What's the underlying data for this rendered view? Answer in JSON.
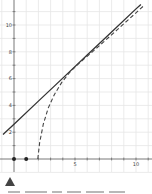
{
  "chart_data": {
    "type": "line",
    "title": "",
    "xlabel": "",
    "ylabel": "",
    "xlim": [
      -1.1,
      11
    ],
    "ylim": [
      -0.6,
      11.8
    ],
    "grid": true,
    "x_ticks": [
      {
        "value": 5,
        "label": "5"
      },
      {
        "value": 10,
        "label": "10"
      }
    ],
    "y_ticks": [
      {
        "value": 2,
        "label": "2"
      },
      {
        "value": 4,
        "label": "4"
      },
      {
        "value": 6,
        "label": "6"
      },
      {
        "value": 8,
        "label": "8"
      },
      {
        "value": 10,
        "label": "10"
      }
    ],
    "series": [
      {
        "name": "solid-line",
        "style": "solid",
        "color": "#333333",
        "x": [
          -0.9,
          0,
          2,
          4,
          6,
          8,
          10,
          10.4
        ],
        "y": [
          1.83,
          2.6,
          4.32,
          6.04,
          7.76,
          9.48,
          11.2,
          11.54
        ]
      },
      {
        "name": "dashed-curve",
        "style": "dashed",
        "color": "#444444",
        "x": [
          1.95,
          2.1,
          2.4,
          2.8,
          3.3,
          3.9,
          4.6,
          5.4,
          6.3,
          7.3,
          8.4,
          9.5,
          10.6
        ],
        "y": [
          0,
          1.2,
          2.6,
          3.8,
          4.8,
          5.7,
          6.5,
          7.2,
          7.9,
          8.7,
          9.6,
          10.5,
          11.4
        ]
      }
    ],
    "points": [
      {
        "x": 0,
        "y": 0
      },
      {
        "x": 1,
        "y": 0
      }
    ]
  },
  "colors": {
    "axis": "#555555",
    "grid": "#e6e6e6",
    "line": "#333333",
    "marker": "#444444"
  },
  "marker_icon": "triangle-up-icon"
}
